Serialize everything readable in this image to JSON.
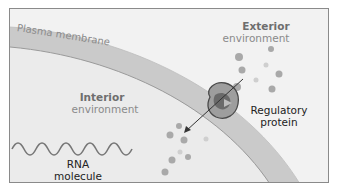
{
  "diagram": {
    "labels": {
      "membrane": "Plasma membrane",
      "exterior_title": "Exterior",
      "exterior_sub": "environment",
      "interior_title": "Interior",
      "interior_sub": "environment",
      "protein_line1": "Regulatory",
      "protein_line2": "protein",
      "rna_line1": "RNA",
      "rna_line2": "molecule"
    },
    "colors": {
      "background": "#f2f2f2",
      "interior": "#e9e9e9",
      "membrane": "#c9c9c9",
      "protein_outer": "#8a8a8a",
      "protein_inner": "#5e5e5e",
      "molecules": "#a8a8a8",
      "rna": "#777777"
    }
  }
}
